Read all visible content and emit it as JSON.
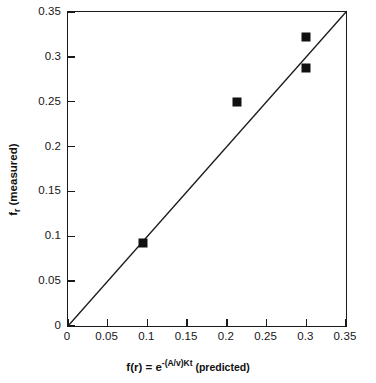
{
  "chart_data": {
    "type": "scatter",
    "title": "",
    "xlabel": "f(r) = e-(A/v)Kt (predicted)",
    "xlabel_parts": {
      "base": "f(r) = e",
      "exponent": "-(A/v)Kt",
      "tail": " (predicted)"
    },
    "ylabel": "fr (measured)",
    "ylabel_parts": {
      "base": "f",
      "subscript": "r",
      "tail": " (measured)"
    },
    "xlim": [
      0,
      0.35
    ],
    "ylim": [
      0,
      0.35
    ],
    "xticks": [
      0,
      0.05,
      0.1,
      0.15,
      0.2,
      0.25,
      0.3,
      0.35
    ],
    "yticks": [
      0,
      0.05,
      0.1,
      0.15,
      0.2,
      0.25,
      0.3,
      0.35
    ],
    "xticklabels": [
      "0",
      "0.05",
      "0.1",
      "0.15",
      "0.2",
      "0.25",
      "0.3",
      "0.35"
    ],
    "yticklabels": [
      "0",
      "0.05",
      "0.1",
      "0.15",
      "0.2",
      "0.25",
      "0.3",
      "0.35"
    ],
    "grid": false,
    "legend": null,
    "marker_style": "filled-square",
    "marker_color": "#111111",
    "line_color": "#1a1a1a",
    "points": [
      {
        "x": 0.094,
        "y": 0.093
      },
      {
        "x": 0.213,
        "y": 0.25
      },
      {
        "x": 0.3,
        "y": 0.322
      },
      {
        "x": 0.3,
        "y": 0.288
      }
    ],
    "reference_line": {
      "name": "identity-line",
      "from": [
        0,
        0
      ],
      "to": [
        0.35,
        0.35
      ]
    }
  }
}
